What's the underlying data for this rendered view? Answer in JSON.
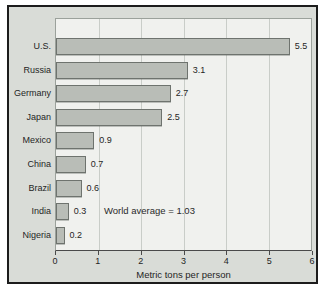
{
  "chart_data": {
    "type": "bar",
    "orientation": "horizontal",
    "title": "",
    "categories": [
      "U.S.",
      "Russia",
      "Germany",
      "Japan",
      "Mexico",
      "China",
      "Brazil",
      "India",
      "Nigeria"
    ],
    "values": [
      5.5,
      3.1,
      2.7,
      2.5,
      0.9,
      0.7,
      0.6,
      0.3,
      0.2
    ],
    "value_labels": [
      "5.5",
      "3.1",
      "2.7",
      "2.5",
      "0.9",
      "0.7",
      "0.6",
      "0.3",
      "0.2"
    ],
    "annotation": "World average = 1.03",
    "xlabel": "Metric tons per person",
    "ylabel": "",
    "xlim": [
      0,
      6
    ],
    "xticks": [
      0,
      1,
      2,
      3,
      4,
      5,
      6
    ],
    "grid": "vertical-gridlines-on",
    "legend": "none",
    "colors": {
      "bar_fill": "#b9bdb7",
      "bar_border": "#6e736e",
      "panel_background": "#d9dcd7",
      "plot_background": "#f0f1ee",
      "gridline": "#c9cdc8",
      "outer_border": "#1c1c1c",
      "text": "#1f1f1f"
    }
  }
}
